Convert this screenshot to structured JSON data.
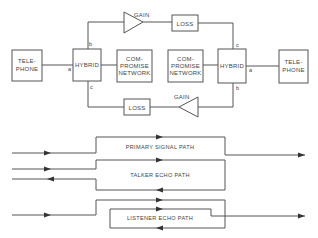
{
  "diagram": {
    "network": {
      "telephone_left": {
        "lines": [
          "TELE-",
          "PHONE"
        ]
      },
      "telephone_right": {
        "lines": [
          "TELE-",
          "PHONE"
        ]
      },
      "hybrid_left": {
        "label": "HYBRID",
        "ports": {
          "a": "a",
          "b": "b",
          "c": "c"
        }
      },
      "hybrid_right": {
        "label": "HYBRID",
        "ports": {
          "a": "a",
          "b": "b",
          "c": "c"
        }
      },
      "compromise_left": {
        "lines": [
          "COM-",
          "PROMISE",
          "NETWORK"
        ]
      },
      "compromise_right": {
        "lines": [
          "COM-",
          "PROMISE",
          "NETWORK"
        ]
      },
      "gain_top": {
        "label": "GAIN"
      },
      "loss_top": {
        "label": "LOSS"
      },
      "gain_bottom": {
        "label": "GAIN"
      },
      "loss_bottom": {
        "label": "LOSS"
      }
    },
    "paths": {
      "primary": {
        "label": "PRIMARY SIGNAL PATH"
      },
      "talker_echo": {
        "label": "TALKER ECHO PATH"
      },
      "listener_echo": {
        "label": "LISTENER ECHO PATH"
      }
    },
    "colors": {
      "line": "#555555",
      "text": "#444444",
      "background": "#ffffff"
    }
  }
}
